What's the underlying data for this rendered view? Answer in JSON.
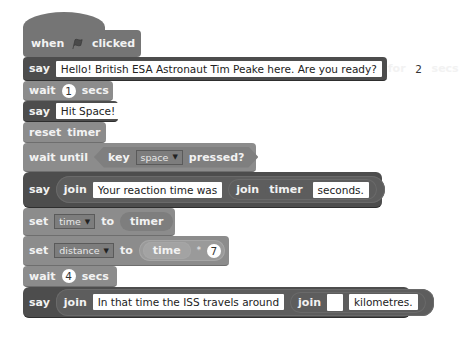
{
  "script": {
    "hat": {
      "when": "when",
      "icon": "green-flag-icon",
      "clicked": "clicked"
    },
    "say1": {
      "say": "say",
      "message": "Hello! British ESA Astronaut Tim Peake here. Are you ready?",
      "for": "for",
      "secs_value": "2",
      "secs": "secs"
    },
    "wait1": {
      "wait": "wait",
      "value": "1",
      "secs": "secs"
    },
    "say2": {
      "say": "say",
      "message": "Hit Space!"
    },
    "reset": {
      "label1": "reset",
      "label2": "timer"
    },
    "wait_until": {
      "wait_until": "wait until",
      "key": "key",
      "key_option": "space",
      "pressed": "pressed?"
    },
    "say3": {
      "say": "say",
      "join": "join",
      "text1": "Your reaction time was",
      "join2": "join",
      "timer": "timer",
      "text2": "seconds."
    },
    "set_time": {
      "set": "set",
      "variable": "time",
      "to": "to",
      "value": "timer"
    },
    "set_distance": {
      "set": "set",
      "variable": "distance",
      "to": "to",
      "operand": "time",
      "operator": "*",
      "number": "7"
    },
    "wait4": {
      "wait": "wait",
      "value": "4",
      "secs": "secs"
    },
    "say4": {
      "say": "say",
      "join": "join",
      "text1": "In that time the ISS travels around",
      "join2": "join",
      "blank": "",
      "text2": "kilometres."
    }
  }
}
